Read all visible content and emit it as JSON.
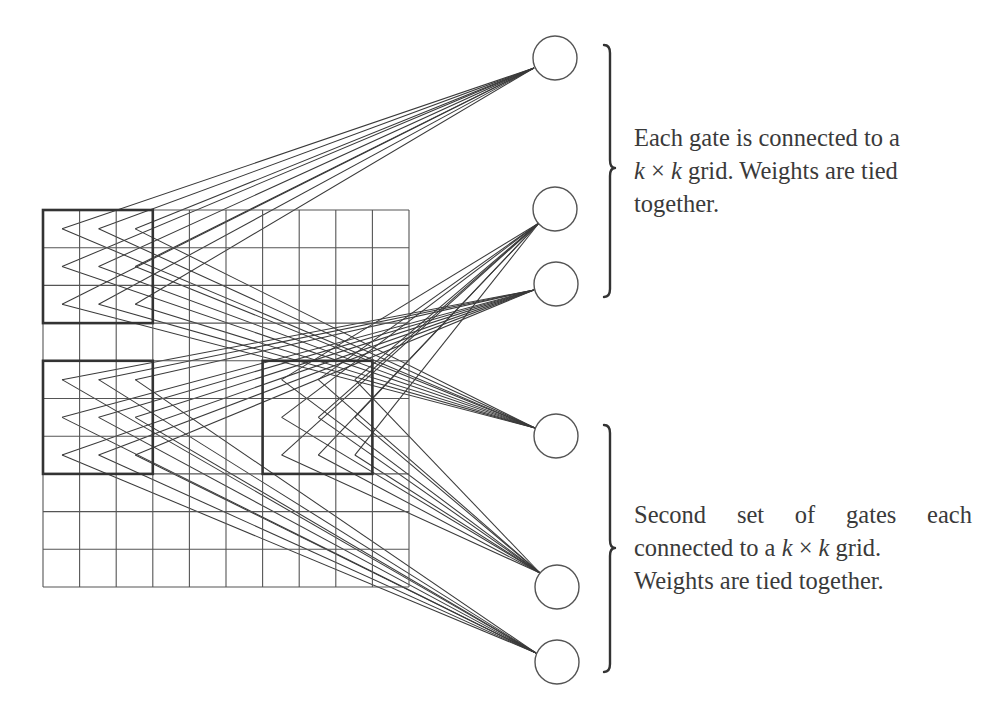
{
  "diagram": {
    "type": "convolutional-gates-weight-sharing",
    "grid": {
      "rows": 10,
      "cols": 10,
      "x0": 43,
      "y0": 210,
      "x1": 409,
      "y1": 587
    },
    "kernel_size": 3,
    "receptive_fields": [
      {
        "id": "top-left-field",
        "row": 0,
        "col": 0
      },
      {
        "id": "middle-left-field",
        "row": 4,
        "col": 0
      },
      {
        "id": "middle-right-field",
        "row": 4,
        "col": 6
      }
    ],
    "gates": [
      {
        "id": "gate-1",
        "cx": 555,
        "cy": 58,
        "r": 22,
        "port": [
          534,
          68
        ],
        "field": "top-left-field",
        "group": 1
      },
      {
        "id": "gate-2",
        "cx": 555,
        "cy": 209,
        "r": 22,
        "port": [
          539,
          223
        ],
        "field": "middle-right-field",
        "group": 1
      },
      {
        "id": "gate-3",
        "cx": 556,
        "cy": 284,
        "r": 22,
        "port": [
          534,
          290
        ],
        "field": "middle-left-field",
        "group": 1
      },
      {
        "id": "gate-4",
        "cx": 556,
        "cy": 436,
        "r": 22,
        "port": [
          535,
          428
        ],
        "field": "top-left-field",
        "group": 2
      },
      {
        "id": "gate-5",
        "cx": 557,
        "cy": 587,
        "r": 22,
        "port": [
          540,
          573
        ],
        "field": "middle-right-field",
        "group": 2
      },
      {
        "id": "gate-6",
        "cx": 557,
        "cy": 662,
        "r": 22,
        "port": [
          536,
          653
        ],
        "field": "middle-left-field",
        "group": 2
      }
    ],
    "braces": [
      {
        "id": "brace-1",
        "x": 610,
        "y_top": 45,
        "y_bottom": 297,
        "y_tip": 168
      },
      {
        "id": "brace-2",
        "x": 610,
        "y_top": 425,
        "y_bottom": 672,
        "y_tip": 548
      }
    ],
    "colors": {
      "line": "#3a3a3a",
      "grid": "#555555",
      "text": "#3a3a3a",
      "background": "#ffffff"
    }
  },
  "annotations": {
    "first_set": {
      "line1": "Each gate is connected to a",
      "line2_k1": "k",
      "line2_times": " × ",
      "line2_k2": "k",
      "line2_rest": " grid. Weights are tied",
      "line3": "together."
    },
    "second_set": {
      "line1_words": [
        "Second",
        "set",
        "of",
        "gates",
        "each"
      ],
      "line2_pre": "connected to a ",
      "line2_k1": "k",
      "line2_times": " × ",
      "line2_k2": "k",
      "line2_rest": " grid.",
      "line3": "Weights are tied together."
    }
  }
}
